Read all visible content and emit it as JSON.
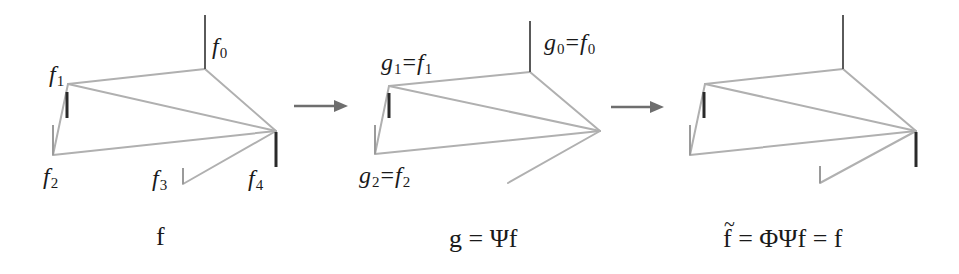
{
  "panels": [
    {
      "id": "f",
      "caption": "f",
      "labels": [
        {
          "base": "f",
          "sub": "0"
        },
        {
          "base": "f",
          "sub": "1"
        },
        {
          "base": "f",
          "sub": "2"
        },
        {
          "base": "f",
          "sub": "3"
        },
        {
          "base": "f",
          "sub": "4"
        }
      ]
    },
    {
      "id": "g",
      "caption": "g = Ψf",
      "labels": [
        {
          "lhs": "g",
          "lhs_sub": "0",
          "eq": "=",
          "rhs": "f",
          "rhs_sub": "0"
        },
        {
          "lhs": "g",
          "lhs_sub": "1",
          "eq": "=",
          "rhs": "f",
          "rhs_sub": "1"
        },
        {
          "lhs": "g",
          "lhs_sub": "2",
          "eq": "=",
          "rhs": "f",
          "rhs_sub": "2"
        }
      ]
    },
    {
      "id": "f-tilde",
      "caption_tilde": "~",
      "caption_f": "f",
      "caption_rest": " = ΦΨf = f"
    }
  ],
  "arrows": [
    {
      "from": "f",
      "to": "g"
    },
    {
      "from": "g",
      "to": "f-tilde"
    }
  ],
  "colors": {
    "edge": "#b0b0b0",
    "stem_dark": "#2a2a2a",
    "arrow": "#6e6e6e"
  }
}
